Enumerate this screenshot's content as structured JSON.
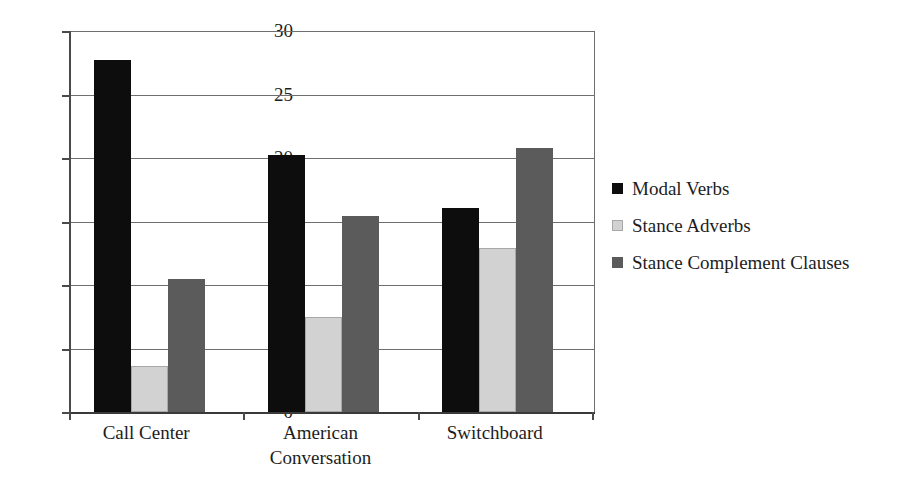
{
  "chart_data": {
    "type": "bar",
    "title": "",
    "xlabel": "",
    "ylabel": "",
    "categories": [
      "Call Center",
      "American\nConversation",
      "Switchboard"
    ],
    "series": [
      {
        "name": "Modal Verbs",
        "color": "#0d0d0d",
        "values": [
          27.7,
          20.2,
          16.1
        ]
      },
      {
        "name": "Stance Adverbs",
        "color": "#d2d2d2",
        "values": [
          3.6,
          7.5,
          12.9
        ]
      },
      {
        "name": "Stance Complement Clauses",
        "color": "#5b5b5b",
        "values": [
          10.5,
          15.4,
          20.8
        ]
      }
    ],
    "ylim": [
      0,
      30
    ],
    "yticks": [
      0,
      5,
      10,
      15,
      20,
      25,
      30
    ],
    "ytick_labels": [
      "0",
      "5",
      "10",
      "15",
      "20",
      "25",
      "30"
    ],
    "grid": true,
    "grid_axis": "y",
    "legend_position": "right",
    "legend_entries": [
      "Modal Verbs",
      "Stance Adverbs",
      "Stance Complement Clauses"
    ]
  }
}
